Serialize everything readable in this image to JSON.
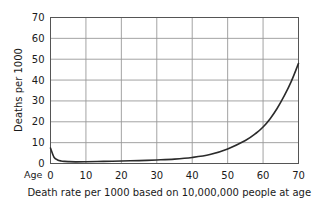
{
  "chart_data": {
    "type": "line",
    "title": "",
    "subtitle": "",
    "caption": "Death rate per 1000  based on 10,000,000 people at age 0",
    "xlabel": "Age",
    "ylabel": "Deaths  per 1000",
    "xlim": [
      0,
      70
    ],
    "ylim": [
      0,
      70
    ],
    "xticks": [
      0,
      10,
      20,
      30,
      40,
      50,
      60,
      70
    ],
    "yticks": [
      0,
      10,
      20,
      30,
      40,
      50,
      60,
      70
    ],
    "xtick_labels": [
      "0",
      "10",
      "20",
      "30",
      "40",
      "50",
      "60",
      "70"
    ],
    "ytick_labels": [
      "0",
      "10",
      "20",
      "30",
      "40",
      "50",
      "60",
      "70"
    ],
    "grid": true,
    "legend": "none",
    "line_color": "#2b2b2b",
    "grid_color": "#999999",
    "axis_color": "#4d4d4d",
    "background_color": "#ffffff",
    "series": [
      {
        "name": "Death rate",
        "x": [
          0,
          1,
          2,
          3,
          4,
          5,
          7,
          10,
          15,
          20,
          25,
          30,
          35,
          40,
          45,
          50,
          55,
          58,
          60,
          62,
          64,
          66,
          68,
          70
        ],
        "values": [
          7.4,
          3.0,
          1.7,
          1.2,
          1.0,
          0.9,
          0.8,
          0.85,
          1.0,
          1.2,
          1.4,
          1.7,
          2.1,
          2.9,
          4.3,
          7.0,
          11.0,
          14.5,
          17.5,
          21.5,
          26.5,
          32.5,
          39.5,
          48.0
        ]
      }
    ]
  },
  "axis": {
    "y_title": "Deaths  per 1000",
    "x_origin_label": "Age"
  }
}
